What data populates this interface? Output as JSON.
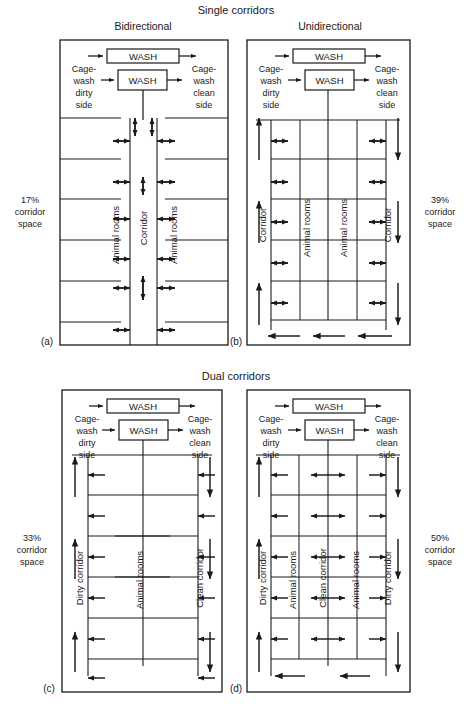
{
  "figure": {
    "sections": [
      {
        "id": "single",
        "title": "Single corridors"
      },
      {
        "id": "dual",
        "title": "Dual corridors"
      }
    ],
    "common": {
      "wash_label": "WASH",
      "cagewash_dirty": "Cage-\nwash\ndirty\nside",
      "cagewash_dirty_lines": [
        "Cage-",
        "wash",
        "dirty",
        "side"
      ],
      "cagewash_clean_lines": [
        "Cage-",
        "wash",
        "clean",
        "side"
      ],
      "corridor_space_suffix_lines": [
        "corridor",
        "space"
      ],
      "label_animal_rooms": "Animal rooms",
      "label_corridor": "Corridor",
      "label_dirty_corridor": "Dirty corridor",
      "label_clean_corridor": "Clean corridor"
    },
    "panels": [
      {
        "key": "a",
        "letter": "(a)",
        "section": "Single corridors",
        "title": "Bidirectional",
        "corridor_space": "17%",
        "corridor_space_lines": [
          "17%",
          "corridor",
          "space"
        ],
        "wash_boxes": [
          "WASH",
          "WASH"
        ],
        "left_text_lines": [
          "Cage-",
          "wash",
          "dirty",
          "side"
        ],
        "right_text_lines": [
          "Cage-",
          "wash",
          "clean",
          "side"
        ],
        "column_labels": [
          "Animal rooms",
          "Corridor",
          "Animal rooms"
        ],
        "flow": "bidirectional"
      },
      {
        "key": "b",
        "letter": "(b)",
        "section": "Single corridors",
        "title": "Unidirectional",
        "corridor_space": "39%",
        "corridor_space_lines": [
          "39%",
          "corridor",
          "space"
        ],
        "wash_boxes": [
          "WASH",
          "WASH"
        ],
        "left_text_lines": [
          "Cage-",
          "wash",
          "dirty",
          "side"
        ],
        "right_text_lines": [
          "Cage-",
          "wash",
          "clean",
          "side"
        ],
        "column_labels": [
          "Corridor",
          "Animal rooms",
          "Animal rooms",
          "Corridor"
        ],
        "flow": "unidirectional"
      },
      {
        "key": "c",
        "letter": "(c)",
        "section": "Dual corridors",
        "title": "",
        "corridor_space": "33%",
        "corridor_space_lines": [
          "33%",
          "corridor",
          "space"
        ],
        "wash_boxes": [
          "WASH",
          "WASH"
        ],
        "left_text_lines": [
          "Cage-",
          "wash",
          "dirty",
          "side"
        ],
        "right_text_lines": [
          "Cage-",
          "wash",
          "clean",
          "side"
        ],
        "column_labels": [
          "Dirty corridor",
          "Animal rooms",
          "Clean corridor"
        ],
        "flow": "unidirectional"
      },
      {
        "key": "d",
        "letter": "(d)",
        "section": "Dual corridors",
        "title": "",
        "corridor_space": "50%",
        "corridor_space_lines": [
          "50%",
          "corridor",
          "space"
        ],
        "wash_boxes": [
          "WASH",
          "WASH"
        ],
        "left_text_lines": [
          "Cage-",
          "wash",
          "dirty",
          "side"
        ],
        "right_text_lines": [
          "Cage-",
          "wash",
          "clean",
          "side"
        ],
        "column_labels": [
          "Dirty corridor",
          "Animal rooms",
          "Clean corridor",
          "Animal rooms",
          "Dirty corridor"
        ],
        "flow": "unidirectional"
      }
    ]
  }
}
